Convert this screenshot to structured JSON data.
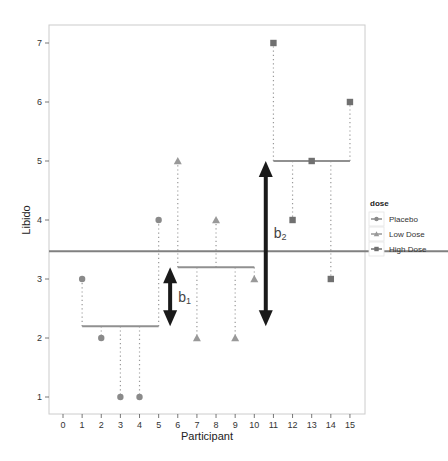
{
  "chart_data": {
    "type": "scatter",
    "title": "",
    "xlabel": "Participant",
    "ylabel": "Libido",
    "xlim": [
      -0.7,
      15.7
    ],
    "ylim": [
      0.3,
      7.3
    ],
    "x_ticks": [
      0,
      1,
      2,
      3,
      4,
      5,
      6,
      7,
      8,
      9,
      10,
      11,
      12,
      13,
      14,
      15
    ],
    "y_ticks": [
      1,
      2,
      3,
      4,
      5,
      6,
      7
    ],
    "grid": false,
    "legend": {
      "title": "dose",
      "position": "right",
      "entries": [
        "Placebo",
        "Low Dose",
        "High Dose"
      ]
    },
    "grand_mean": 3.47,
    "series": [
      {
        "name": "Placebo",
        "marker": "circle",
        "color": "#8a8a8a",
        "x": [
          1,
          2,
          3,
          4,
          5
        ],
        "values": [
          3,
          2,
          1,
          1,
          4
        ],
        "group_mean": 2.2,
        "mean_span": [
          1,
          5
        ]
      },
      {
        "name": "Low Dose",
        "marker": "triangle",
        "color": "#999999",
        "x": [
          6,
          7,
          8,
          9,
          10
        ],
        "values": [
          5,
          2,
          4,
          2,
          3
        ],
        "group_mean": 3.2,
        "mean_span": [
          6,
          10
        ]
      },
      {
        "name": "High Dose",
        "marker": "square",
        "color": "#707070",
        "x": [
          11,
          12,
          13,
          14,
          15
        ],
        "values": [
          7,
          4,
          5,
          3,
          6
        ],
        "group_mean": 5.0,
        "mean_span": [
          11,
          15
        ]
      }
    ],
    "annotations": [
      {
        "label": "b",
        "subscript": "1",
        "type": "double-arrow",
        "x": 5.6,
        "from": 2.2,
        "to": 3.2
      },
      {
        "label": "b",
        "subscript": "2",
        "type": "double-arrow",
        "x": 10.6,
        "from": 2.2,
        "to": 5.0
      }
    ]
  },
  "labels": {
    "xlabel": "Participant",
    "ylabel": "Libido",
    "legend_title": "dose",
    "legend_entries": [
      "Placebo",
      "Low Dose",
      "High Dose"
    ],
    "b1": "b",
    "b1_sub": "1",
    "b2": "b",
    "b2_sub": "2"
  }
}
